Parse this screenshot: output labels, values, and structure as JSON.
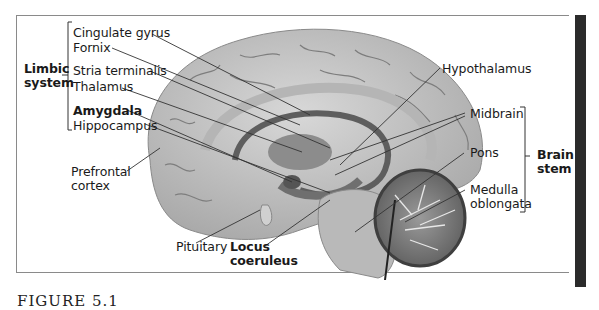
{
  "figure": {
    "caption": "FIGURE 5.1",
    "groups": {
      "limbic_system": "Limbic\nsystem",
      "limbic_line1": "Limbic",
      "limbic_line2": "system",
      "brain_stem_line1": "Brain",
      "brain_stem_line2": "stem"
    },
    "labels_left": [
      {
        "text": "Cingulate gyrus",
        "bold": false
      },
      {
        "text": "Fornix",
        "bold": false
      },
      {
        "text": "Stria terminalis",
        "bold": false
      },
      {
        "text": "Thalamus",
        "bold": false
      },
      {
        "text": "Amygdala",
        "bold": true
      },
      {
        "text": "Hippocampus",
        "bold": false
      }
    ],
    "prefrontal": {
      "line1": "Prefrontal",
      "line2": "cortex"
    },
    "labels_bottom": {
      "pituitary": "Pituitary",
      "locus_line1": "Locus",
      "locus_line2": "coeruleus"
    },
    "labels_right": {
      "hypothalamus": "Hypothalamus",
      "midbrain": "Midbrain",
      "pons": "Pons",
      "medulla_line1": "Medulla",
      "medulla_line2": "oblongata"
    },
    "colors": {
      "brain_light": "#c9c9c9",
      "brain_mid": "#a8a8a8",
      "brain_dark": "#6a6a6a",
      "leader_line": "#333333",
      "frame_border": "#8a8a8a",
      "side_bar": "#2b2b2b"
    }
  }
}
